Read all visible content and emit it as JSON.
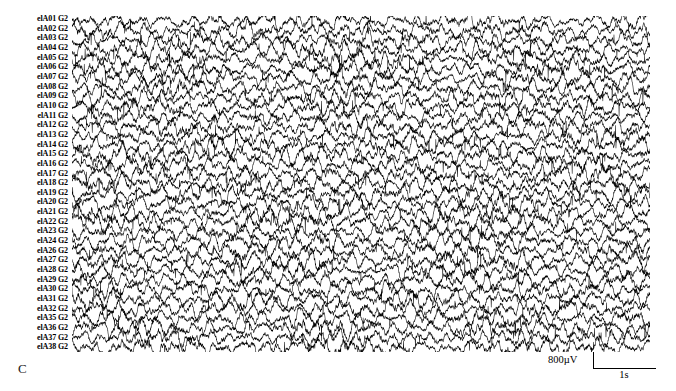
{
  "panel": {
    "letter": "C"
  },
  "chart_data": {
    "type": "line",
    "title": "",
    "subtitle": "",
    "xlabel": "",
    "ylabel": "",
    "grid": false,
    "legend_position": "none",
    "signal_color": "#000000",
    "background_color": "#ffffff",
    "n_channels": 35,
    "reference": "G2",
    "x_axis": {
      "unit": "s",
      "range": [
        0,
        12
      ],
      "tick_labels": [],
      "duration_seconds": 12
    },
    "y_axis": {
      "unit": "µV",
      "per_channel_scale_uv": 800,
      "tick_labels": []
    },
    "channels": [
      {
        "label": "elA01 G2",
        "name": "elA01",
        "reference": "G2",
        "amplitude_uv": 780
      },
      {
        "label": "elA02 G2",
        "name": "elA02",
        "reference": "G2",
        "amplitude_uv": 820
      },
      {
        "label": "elA03 G2",
        "name": "elA03",
        "reference": "G2",
        "amplitude_uv": 760
      },
      {
        "label": "elA04 G2",
        "name": "elA04",
        "reference": "G2",
        "amplitude_uv": 840
      },
      {
        "label": "elA05 G2",
        "name": "elA05",
        "reference": "G2",
        "amplitude_uv": 800
      },
      {
        "label": "elA06 G2",
        "name": "elA06",
        "reference": "G2",
        "amplitude_uv": 870
      },
      {
        "label": "elA07 G2",
        "name": "elA07",
        "reference": "G2",
        "amplitude_uv": 790
      },
      {
        "label": "elA08 G2",
        "name": "elA08",
        "reference": "G2",
        "amplitude_uv": 810
      },
      {
        "label": "elA09 G2",
        "name": "elA09",
        "reference": "G2",
        "amplitude_uv": 850
      },
      {
        "label": "elA10 G2",
        "name": "elA10",
        "reference": "G2",
        "amplitude_uv": 830
      },
      {
        "label": "elA11 G2",
        "name": "elA11",
        "reference": "G2",
        "amplitude_uv": 770
      },
      {
        "label": "elA12 G2",
        "name": "elA12",
        "reference": "G2",
        "amplitude_uv": 860
      },
      {
        "label": "elA13 G2",
        "name": "elA13",
        "reference": "G2",
        "amplitude_uv": 800
      },
      {
        "label": "elA14 G2",
        "name": "elA14",
        "reference": "G2",
        "amplitude_uv": 820
      },
      {
        "label": "elA15 G2",
        "name": "elA15",
        "reference": "G2",
        "amplitude_uv": 880
      },
      {
        "label": "elA16 G2",
        "name": "elA16",
        "reference": "G2",
        "amplitude_uv": 790
      },
      {
        "label": "elA17 G2",
        "name": "elA17",
        "reference": "G2",
        "amplitude_uv": 840
      },
      {
        "label": "elA18 G2",
        "name": "elA18",
        "reference": "G2",
        "amplitude_uv": 810
      },
      {
        "label": "elA19 G2",
        "name": "elA19",
        "reference": "G2",
        "amplitude_uv": 860
      },
      {
        "label": "elA20 G2",
        "name": "elA20",
        "reference": "G2",
        "amplitude_uv": 800
      },
      {
        "label": "elA21 G2",
        "name": "elA21",
        "reference": "G2",
        "amplitude_uv": 830
      },
      {
        "label": "elA22 G2",
        "name": "elA22",
        "reference": "G2",
        "amplitude_uv": 870
      },
      {
        "label": "elA23 G2",
        "name": "elA23",
        "reference": "G2",
        "amplitude_uv": 780
      },
      {
        "label": "elA24 G2",
        "name": "elA24",
        "reference": "G2",
        "amplitude_uv": 850
      },
      {
        "label": "elA26 G2",
        "name": "elA26",
        "reference": "G2",
        "amplitude_uv": 820
      },
      {
        "label": "elA27 G2",
        "name": "elA27",
        "reference": "G2",
        "amplitude_uv": 890
      },
      {
        "label": "elA28 G2",
        "name": "elA28",
        "reference": "G2",
        "amplitude_uv": 800
      },
      {
        "label": "elA29 G2",
        "name": "elA29",
        "reference": "G2",
        "amplitude_uv": 840
      },
      {
        "label": "elA30 G2",
        "name": "elA30",
        "reference": "G2",
        "amplitude_uv": 810
      },
      {
        "label": "elA31 G2",
        "name": "elA31",
        "reference": "G2",
        "amplitude_uv": 860
      },
      {
        "label": "elA32 G2",
        "name": "elA32",
        "reference": "G2",
        "amplitude_uv": 790
      },
      {
        "label": "elA35 G2",
        "name": "elA35",
        "reference": "G2",
        "amplitude_uv": 830
      },
      {
        "label": "elA36 G2",
        "name": "elA36",
        "reference": "G2",
        "amplitude_uv": 870
      },
      {
        "label": "elA37 G2",
        "name": "elA37",
        "reference": "G2",
        "amplitude_uv": 800
      },
      {
        "label": "elA38 G2",
        "name": "elA38",
        "reference": "G2",
        "amplitude_uv": 845
      }
    ]
  },
  "scale_bar": {
    "voltage_label": "800µV",
    "voltage_value": 800,
    "voltage_unit": "µV",
    "time_label": "1s",
    "time_value": 1,
    "time_unit": "s"
  }
}
